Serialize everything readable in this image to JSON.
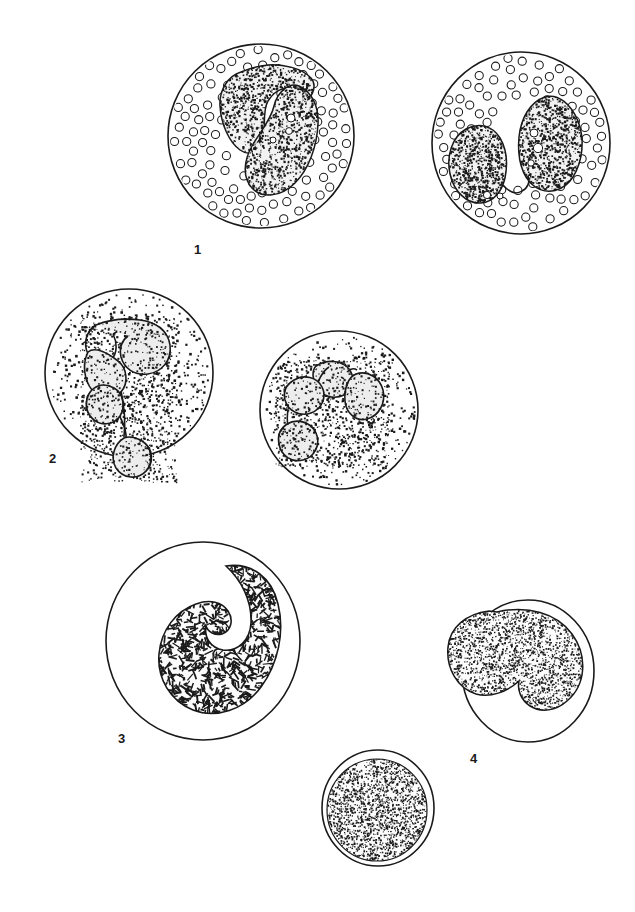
{
  "figure": {
    "background_color": "#ffffff",
    "ink_color": "#1a1a1a",
    "width": 635,
    "height": 912,
    "style": "black-and-white stippled line drawing"
  },
  "labels": [
    {
      "id": "label-1",
      "text": "1",
      "x": 194,
      "y": 243
    },
    {
      "id": "label-2",
      "text": "2",
      "x": 49,
      "y": 452
    },
    {
      "id": "label-3",
      "text": "3",
      "x": 118,
      "y": 732
    },
    {
      "id": "label-4",
      "text": "4",
      "x": 470,
      "y": 752
    }
  ],
  "cells": [
    {
      "id": "cell-1a",
      "label_ref": "1",
      "name": "neutrophil-left",
      "cytoplasm_texture": "open-circle-granules",
      "nucleus_shape": "two-lobed-s-curve",
      "center_x": 261,
      "center_y": 136,
      "radius_x": 93,
      "radius_y": 92,
      "granule_count": 112,
      "granule_radius": 4.1
    },
    {
      "id": "cell-1b",
      "label_ref": "1",
      "name": "neutrophil-right",
      "cytoplasm_texture": "open-circle-granules",
      "nucleus_shape": "two-lobed-horseshoe",
      "center_x": 521,
      "center_y": 143,
      "radius_x": 89,
      "radius_y": 91,
      "granule_count": 108,
      "granule_radius": 4.1
    },
    {
      "id": "cell-2a",
      "label_ref": "2",
      "name": "eosinophil-left",
      "cytoplasm_texture": "dense-dot-granules",
      "nucleus_shape": "segmented-three-lobe-chain",
      "center_x": 129,
      "center_y": 373,
      "radius_x": 84,
      "radius_y": 84,
      "granule_count": 520,
      "granule_radius": 1.5
    },
    {
      "id": "cell-2b",
      "label_ref": "2",
      "name": "eosinophil-right",
      "cytoplasm_texture": "dense-dot-granules",
      "nucleus_shape": "segmented-four-lobe-arc",
      "center_x": 339,
      "center_y": 410,
      "radius_x": 79,
      "radius_y": 79,
      "granule_count": 470,
      "granule_radius": 1.5
    },
    {
      "id": "cell-3",
      "label_ref": "3",
      "name": "large-lymphocyte",
      "cytoplasm_texture": "clear",
      "nucleus_shape": "kidney-bean-coarse-chromatin",
      "center_x": 203,
      "center_y": 641,
      "radius_x": 97,
      "radius_y": 99,
      "granule_count": 0,
      "granule_radius": 0
    },
    {
      "id": "cell-4",
      "label_ref": "4",
      "name": "monocyte",
      "cytoplasm_texture": "clear-narrow-rim",
      "nucleus_shape": "kidney-bean-fine-stipple",
      "center_x": 528,
      "center_y": 671,
      "radius_x": 66,
      "radius_y": 71,
      "granule_count": 0,
      "granule_radius": 0
    },
    {
      "id": "cell-5",
      "label_ref": "",
      "name": "small-lymphocyte",
      "cytoplasm_texture": "clear-narrow-rim",
      "nucleus_shape": "round-fine-stipple",
      "center_x": 378,
      "center_y": 808,
      "radius_x": 56,
      "radius_y": 58,
      "granule_count": 0,
      "granule_radius": 0
    }
  ],
  "legend": {
    "entry_1": "1",
    "entry_2": "2",
    "entry_3": "3",
    "entry_4": "4"
  }
}
